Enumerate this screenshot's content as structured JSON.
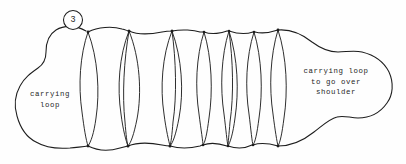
{
  "figure": {
    "number": "3",
    "background_color": "#fefefe",
    "ink_color": "#1d1d1d"
  },
  "annotations": {
    "left_loop": {
      "line1": "carrying",
      "line2": "loop",
      "full_text": "carrying loop"
    },
    "right_loop": {
      "line1": "carrying loop",
      "line2": "to go over",
      "line3": "shoulder",
      "full_text": "carrying loop to go over shoulder"
    }
  },
  "drawing": {
    "outer_outline_path": "M 84 31 C 72 25 58 27 50 35 C 43 42 46 52 45 60 C 44 68 36 71 29 77 C 21 84 16 93 17 104 C 18 116 22 128 30 136 C 38 144 50 148 62 148 C 74 148 80 147 88 146",
    "top_edge_path": "M 88 32 C 100 28 116 28 129 31 C 142 34 160 32 172 31 C 184 30 195 31 204 32 C 213 33 221 31 229 31 C 237 31 246 32 254 32 C 262 32 271 31 278 30",
    "bottom_edge_path": "M 88 146 C 100 149 116 148 128 146 C 140 144 158 145 170 146 C 182 147 194 146 203 145 C 212 144 220 146 228 146 C 236 146 245 145 253 145 C 261 145 270 146 278 146",
    "right_lobe_path": "M 278 30 C 292 30 305 36 316 44 C 327 52 336 53 348 52 C 362 51 376 56 385 66 C 394 76 396 89 392 100 C 388 111 377 118 366 119 C 356 120 348 116 340 117 C 330 118 322 126 313 133 C 303 141 291 146 278 146",
    "coil_nodes_top_x": [
      88,
      129,
      172,
      204,
      229,
      254,
      278
    ],
    "coil_nodes_bottom_x": [
      88,
      128,
      170,
      203,
      228,
      253,
      278
    ],
    "coil_count": 8,
    "coil_top_y": 31,
    "coil_bottom_y": 146
  },
  "colors": {
    "paper": "#fefefe",
    "line": "#1d1d1d",
    "text": "#262626"
  }
}
